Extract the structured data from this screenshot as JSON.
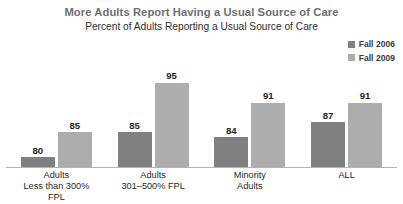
{
  "chart_data": {
    "type": "bar",
    "title": "More Adults Report Having a Usual Source of Care",
    "subtitle": "Percent of Adults Reporting a Usual Source of Care",
    "xlabel": "",
    "ylabel": "",
    "ylim": [
      78,
      97
    ],
    "grid": false,
    "legend_position": "top-right",
    "categories": [
      "Adults Less than 300% FPL",
      "Adults 301–500% FPL",
      "Minority Adults",
      "ALL"
    ],
    "category_lines": [
      {
        "line1": "Adults",
        "line2": "Less than 300% FPL"
      },
      {
        "line1": "Adults",
        "line2": "301–500% FPL"
      },
      {
        "line1": "Minority",
        "line2": "Adults"
      },
      {
        "line1": "ALL",
        "line2": ""
      }
    ],
    "series": [
      {
        "name": "Fall 2006",
        "color": "#808080",
        "values": [
          80,
          85,
          84,
          87
        ]
      },
      {
        "name": "Fall 2009",
        "color": "#adadad",
        "values": [
          85,
          95,
          91,
          91
        ]
      }
    ],
    "note": "Series Fall 2006 holds the left (darker) bar of each pair; Fall 2009 holds the right (lighter) bar. Bars share a common non-zero baseline near 78."
  },
  "colors": {
    "title": "#6e6e6e",
    "subtitle": "#2d2d2d",
    "value_label": "#1f1f1f",
    "category_label": "#1f1f1f",
    "axis_line": "#b4b4b4",
    "background": "#ffffff",
    "series_fall_2006": "#808080",
    "series_fall_2009": "#adadad"
  }
}
